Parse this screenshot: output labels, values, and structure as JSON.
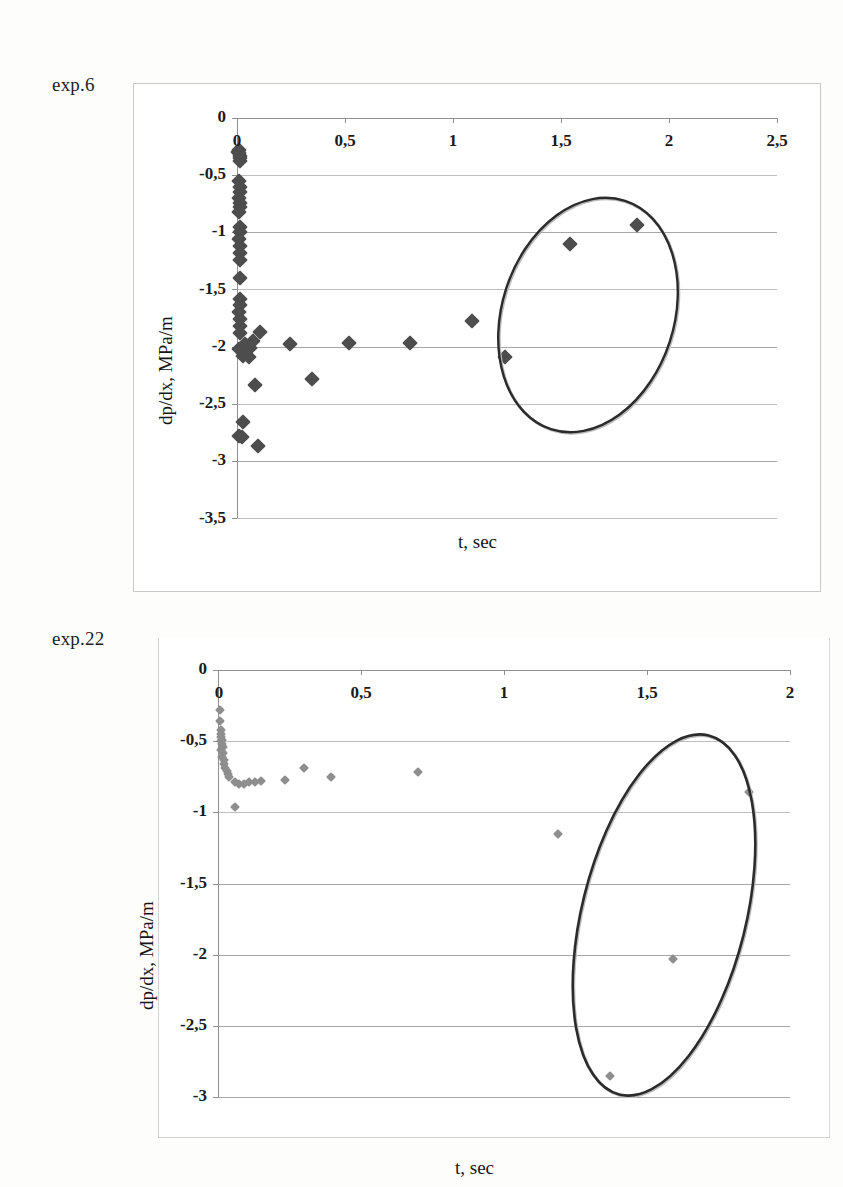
{
  "page": {
    "background": "#fdfdfc",
    "width": 843,
    "height": 1187
  },
  "figures": [
    {
      "caption": "exp.6",
      "marker_color": "#4d4d4d",
      "ellipse_color": "#2b2b2b"
    },
    {
      "caption": "exp.22",
      "marker_color": "#8e8e8e",
      "ellipse_color": "#2b2b2b"
    }
  ],
  "chart_data": [
    {
      "type": "scatter",
      "title": "exp.6",
      "xlabel": "t, sec",
      "ylabel": "dp/dx, MPa/m",
      "xlim": [
        0,
        2.5
      ],
      "ylim": [
        -3.5,
        0
      ],
      "xticks": [
        0,
        0.5,
        1,
        1.5,
        2,
        2.5
      ],
      "xticklabels": [
        "0",
        "0,5",
        "1",
        "1,5",
        "2",
        "2,5"
      ],
      "yticks": [
        0,
        -0.5,
        -1,
        -1.5,
        -2,
        -2.5,
        -3,
        -3.5
      ],
      "yticklabels": [
        "0",
        "-0,5",
        "-1",
        "-1,5",
        "-2",
        "-2,5",
        "-3",
        "-3,5"
      ],
      "grid": "horizontal",
      "legend": "none",
      "marker": "diamond",
      "marker_color": "#4d4d4d",
      "points": [
        [
          0.005,
          -0.3
        ],
        [
          0.01,
          -0.31
        ],
        [
          0.012,
          -0.33
        ],
        [
          0.016,
          -0.35
        ],
        [
          0.008,
          -0.28
        ],
        [
          0.014,
          -0.38
        ],
        [
          0.01,
          -0.55
        ],
        [
          0.012,
          -0.6
        ],
        [
          0.015,
          -0.65
        ],
        [
          0.01,
          -0.7
        ],
        [
          0.013,
          -0.74
        ],
        [
          0.016,
          -0.78
        ],
        [
          0.011,
          -0.82
        ],
        [
          0.012,
          -0.95
        ],
        [
          0.014,
          -1.0
        ],
        [
          0.01,
          -1.06
        ],
        [
          0.013,
          -1.12
        ],
        [
          0.016,
          -1.18
        ],
        [
          0.012,
          -1.24
        ],
        [
          0.014,
          -1.4
        ],
        [
          0.012,
          -1.58
        ],
        [
          0.015,
          -1.64
        ],
        [
          0.011,
          -1.7
        ],
        [
          0.014,
          -1.76
        ],
        [
          0.013,
          -1.82
        ],
        [
          0.016,
          -1.88
        ],
        [
          0.01,
          -2.02
        ],
        [
          0.035,
          -1.98
        ],
        [
          0.06,
          -2.01
        ],
        [
          0.03,
          -2.08
        ],
        [
          0.055,
          -2.09
        ],
        [
          0.075,
          -1.95
        ],
        [
          0.105,
          -1.87
        ],
        [
          0.245,
          -1.98
        ],
        [
          0.085,
          -2.34
        ],
        [
          0.345,
          -2.28
        ],
        [
          0.03,
          -2.66
        ],
        [
          0.01,
          -2.78
        ],
        [
          0.022,
          -2.79
        ],
        [
          0.095,
          -2.87
        ],
        [
          0.52,
          -1.97
        ],
        [
          0.8,
          -1.97
        ],
        [
          1.09,
          -1.78
        ],
        [
          1.24,
          -2.09
        ],
        [
          1.54,
          -1.1
        ],
        [
          1.85,
          -0.94
        ]
      ],
      "annotations": [
        {
          "type": "ellipse",
          "cx": 1.63,
          "cy": -1.73,
          "rx": 0.4,
          "ry": 1.05,
          "rotation_deg": 18,
          "stroke": "#2b2b2b"
        }
      ]
    },
    {
      "type": "scatter",
      "title": "exp.22",
      "xlabel": "t, sec",
      "ylabel": "dp/dx, MPa/m",
      "xlim": [
        0,
        2
      ],
      "ylim": [
        -3,
        0
      ],
      "xticks": [
        0,
        0.5,
        1,
        1.5,
        2
      ],
      "xticklabels": [
        "0",
        "0,5",
        "1",
        "1,5",
        "2"
      ],
      "yticks": [
        0,
        -0.5,
        -1,
        -1.5,
        -2,
        -2.5,
        -3
      ],
      "yticklabels": [
        "0",
        "-0,5",
        "-1",
        "-1,5",
        "-2",
        "-2,5",
        "-3"
      ],
      "grid": "horizontal",
      "legend": "none",
      "marker": "diamond",
      "marker_color": "#8e8e8e",
      "points": [
        [
          0.006,
          -0.28
        ],
        [
          0.008,
          -0.36
        ],
        [
          0.01,
          -0.42
        ],
        [
          0.012,
          -0.45
        ],
        [
          0.009,
          -0.47
        ],
        [
          0.013,
          -0.49
        ],
        [
          0.011,
          -0.5
        ],
        [
          0.014,
          -0.52
        ],
        [
          0.016,
          -0.54
        ],
        [
          0.012,
          -0.56
        ],
        [
          0.018,
          -0.58
        ],
        [
          0.015,
          -0.61
        ],
        [
          0.02,
          -0.63
        ],
        [
          0.022,
          -0.66
        ],
        [
          0.026,
          -0.69
        ],
        [
          0.03,
          -0.71
        ],
        [
          0.034,
          -0.73
        ],
        [
          0.04,
          -0.75
        ],
        [
          0.06,
          -0.79
        ],
        [
          0.075,
          -0.8
        ],
        [
          0.09,
          -0.8
        ],
        [
          0.11,
          -0.79
        ],
        [
          0.13,
          -0.79
        ],
        [
          0.15,
          -0.78
        ],
        [
          0.06,
          -0.96
        ],
        [
          0.235,
          -0.77
        ],
        [
          0.3,
          -0.69
        ],
        [
          0.395,
          -0.75
        ],
        [
          0.7,
          -0.72
        ],
        [
          1.19,
          -1.15
        ],
        [
          1.59,
          -2.03
        ],
        [
          1.855,
          -0.86
        ],
        [
          1.37,
          -2.85
        ]
      ],
      "annotations": [
        {
          "type": "ellipse",
          "cx": 1.56,
          "cy": -1.72,
          "rx": 0.28,
          "ry": 1.3,
          "rotation_deg": 14,
          "stroke": "#2b2b2b"
        }
      ]
    }
  ]
}
